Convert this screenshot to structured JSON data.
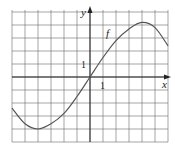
{
  "chart_data": {
    "type": "line",
    "title": "",
    "xlabel": "x",
    "ylabel": "y",
    "curve_label": "f",
    "tick_labels": {
      "x_unit": "1",
      "y_unit": "1"
    },
    "grid": true,
    "xlim": [
      -6,
      6
    ],
    "ylim": [
      -5,
      5
    ],
    "series": [
      {
        "name": "f",
        "x": [
          -6,
          -5,
          -4,
          -3,
          -2,
          -1,
          0,
          1,
          2,
          3,
          4,
          5,
          6
        ],
        "values": [
          -2.4,
          -3.6,
          -4.0,
          -3.6,
          -2.8,
          -1.5,
          0,
          1.5,
          2.8,
          3.7,
          4.2,
          3.8,
          2.4
        ]
      }
    ],
    "extrema": {
      "min": [
        -4,
        -4.0
      ],
      "max": [
        4,
        4.2
      ]
    }
  },
  "colors": {
    "grid": "#555555",
    "axis": "#222222",
    "curve": "#555555"
  }
}
